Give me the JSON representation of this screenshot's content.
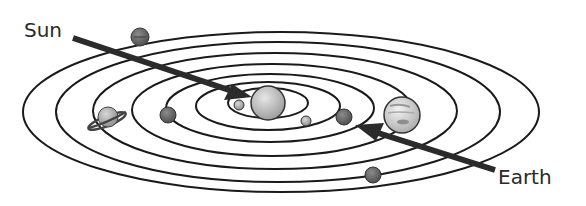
{
  "diagram": {
    "type": "solar-system-orbits",
    "labels": {
      "sun": "Sun",
      "earth": "Earth"
    },
    "center": {
      "x": 268,
      "y": 103
    },
    "orbits": [
      {
        "rx": 40,
        "ry": 15
      },
      {
        "rx": 70,
        "ry": 24
      },
      {
        "rx": 100,
        "ry": 33
      },
      {
        "rx": 135,
        "ry": 44
      },
      {
        "rx": 175,
        "ry": 56
      },
      {
        "rx": 215,
        "ry": 67
      },
      {
        "rx": 255,
        "ry": 78
      }
    ],
    "bodies": [
      {
        "name": "sun",
        "cx": 268,
        "cy": 103,
        "r": 16,
        "fill": "#c8c8c8"
      },
      {
        "name": "mercury",
        "cx": 239,
        "cy": 105,
        "r": 5,
        "fill": "#a8a8a8"
      },
      {
        "name": "venus",
        "cx": 306,
        "cy": 121,
        "r": 5,
        "fill": "#a0a0a0"
      },
      {
        "name": "earth",
        "cx": 344,
        "cy": 117,
        "r": 8,
        "fill": "#6a6a6a"
      },
      {
        "name": "mars",
        "cx": 168,
        "cy": 115,
        "r": 8,
        "fill": "#707070"
      },
      {
        "name": "jupiter",
        "cx": 402,
        "cy": 115,
        "r": 18,
        "fill": "#d0d0d0"
      },
      {
        "name": "saturn",
        "cx": 109,
        "cy": 118,
        "r": 10,
        "fill": "#b8b8b8"
      },
      {
        "name": "uranus",
        "cx": 373,
        "cy": 175,
        "r": 8,
        "fill": "#757575"
      },
      {
        "name": "neptune",
        "cx": 140,
        "cy": 37,
        "r": 9,
        "fill": "#6f6f6f"
      }
    ],
    "arrows": [
      {
        "name": "sun-arrow",
        "from": [
          73,
          38
        ],
        "to": [
          250,
          97
        ]
      },
      {
        "name": "earth-arrow",
        "from": [
          495,
          170
        ],
        "to": [
          357,
          126
        ]
      }
    ],
    "colors": {
      "line": "#1a1a1a",
      "arrow": "#2b2b2b",
      "text": "#2a2a2a",
      "background": "#ffffff"
    }
  }
}
